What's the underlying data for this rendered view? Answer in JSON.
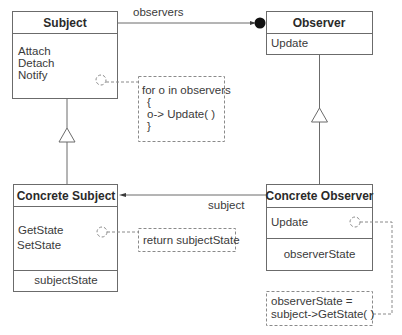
{
  "diagram": {
    "type": "UML class diagram",
    "pattern": "Observer",
    "classes": [
      {
        "id": "subject",
        "name": "Subject",
        "operations": [
          "Attach",
          "Detach",
          "Notify"
        ],
        "attributes": []
      },
      {
        "id": "observer",
        "name": "Observer",
        "operations": [
          "Update"
        ],
        "attributes": []
      },
      {
        "id": "concrete_subject",
        "name": "Concrete Subject",
        "operations": [
          "GetState",
          "SetState"
        ],
        "attributes": [
          "subjectState"
        ]
      },
      {
        "id": "concrete_observer",
        "name": "Concrete Observer",
        "operations": [
          "Update"
        ],
        "attributes": [
          "observerState"
        ]
      }
    ],
    "associations": [
      {
        "from": "subject",
        "to": "observer",
        "label": "observers",
        "multiplicity": "many"
      },
      {
        "from": "concrete_observer",
        "to": "concrete_subject",
        "label": "subject"
      }
    ],
    "generalizations": [
      {
        "child": "concrete_subject",
        "parent": "subject"
      },
      {
        "child": "concrete_observer",
        "parent": "observer"
      }
    ],
    "notes": [
      {
        "attached_to": "subject.Notify",
        "lines": [
          "for o in observers",
          "{",
          "o-> Update( )",
          "}"
        ]
      },
      {
        "attached_to": "concrete_subject.GetState",
        "lines": [
          "return subjectState"
        ]
      },
      {
        "attached_to": "concrete_observer.Update",
        "lines": [
          "observerState =",
          "subject->GetState( )"
        ]
      }
    ]
  },
  "labels": {
    "subject_title": "Subject",
    "subject_ops": [
      "Attach",
      "Detach",
      "Notify"
    ],
    "observer_title": "Observer",
    "observer_ops": [
      "Update"
    ],
    "cs_title": "Concrete Subject",
    "cs_ops": [
      "GetState",
      "SetState"
    ],
    "cs_attr": "subjectState",
    "co_title": "Concrete Observer",
    "co_ops": [
      "Update"
    ],
    "co_attr": "observerState",
    "assoc_observers": "observers",
    "assoc_subject": "subject",
    "note1": [
      "for o in observers",
      "{",
      "o-> Update( )",
      "}"
    ],
    "note2": "return subjectState",
    "note3": [
      "observerState =",
      "subject->GetState( )"
    ]
  }
}
